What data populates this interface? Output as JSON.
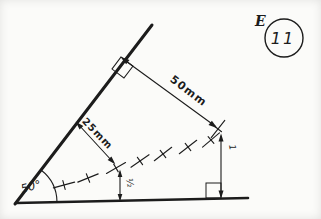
{
  "colors": {
    "ink": "#1c1c1c",
    "paper": "#fbfbf9"
  },
  "badge": {
    "letter": "E",
    "number": "11"
  },
  "diagram": {
    "type": "locus-construction-drawing",
    "angle_label": "50°",
    "dim_50_label": "50mm",
    "dim_25_label": "25mm",
    "height_left_label": "½",
    "height_right_label": "1",
    "locus_points": [
      [
        64,
        185,
        -15
      ],
      [
        88,
        178,
        -22
      ],
      [
        116,
        168,
        -30
      ],
      [
        140,
        161,
        -35
      ],
      [
        163,
        154,
        -38
      ],
      [
        188,
        147,
        -38
      ],
      [
        211,
        140,
        -40
      ],
      [
        218,
        129,
        -52
      ]
    ]
  }
}
